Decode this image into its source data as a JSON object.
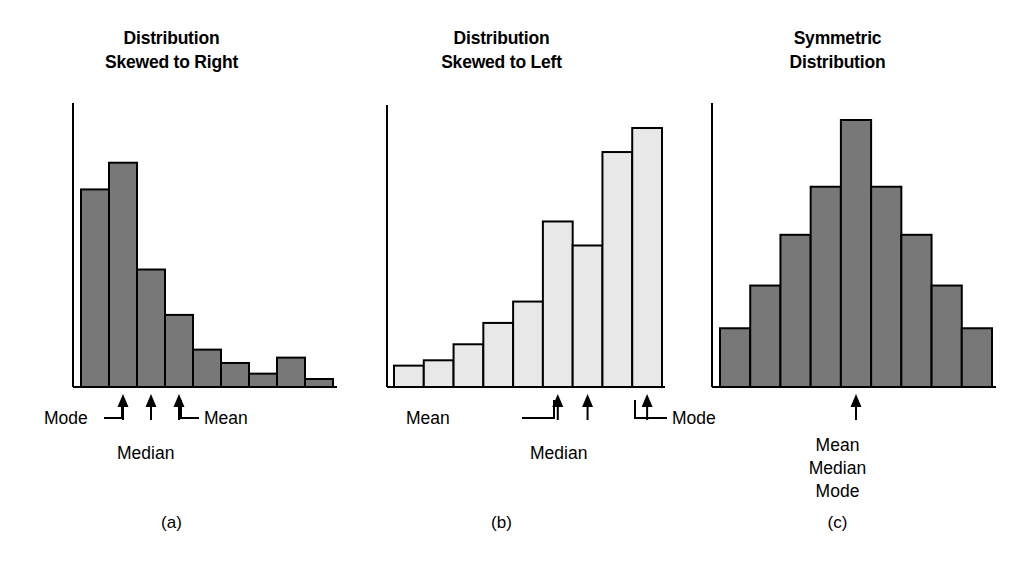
{
  "figure": {
    "caption_a": "(a)",
    "caption_b": "(b)",
    "caption_c": "(c)",
    "colors": {
      "bar_dark": "#787878",
      "bar_light": "#e8e8e8",
      "outline": "#000000",
      "axis": "#000000",
      "background": "#ffffff",
      "text": "#000000"
    }
  },
  "chart_data": [
    {
      "type": "bar",
      "id": "skewed-right",
      "title": "Distribution Skewed to Right",
      "title_line1": "Distribution",
      "title_line2": "Skewed to Right",
      "caption": "(a)",
      "xlabel": "",
      "ylabel": "",
      "grid": false,
      "legend": "none",
      "bar_fill": "#787878",
      "categories": [
        "1",
        "2",
        "3",
        "4",
        "5",
        "6",
        "7",
        "8",
        "9"
      ],
      "values": [
        74,
        84,
        44,
        27,
        14,
        9,
        5,
        11,
        3
      ],
      "ylim": [
        0,
        100
      ],
      "annotations": [
        {
          "name": "Mode",
          "bin": 2,
          "x_frac": 0.185,
          "label_side": "left"
        },
        {
          "name": "Median",
          "bin": 3,
          "x_frac": 0.285,
          "label_side": "below"
        },
        {
          "name": "Mean",
          "bin": 4,
          "x_frac": 0.368,
          "label_side": "right"
        }
      ]
    },
    {
      "type": "bar",
      "id": "skewed-left",
      "title": "Distribution Skewed to Left",
      "title_line1": "Distribution",
      "title_line2": "Skewed to Left",
      "caption": "(b)",
      "xlabel": "",
      "ylabel": "",
      "grid": false,
      "legend": "none",
      "bar_fill": "#e8e8e8",
      "categories": [
        "1",
        "2",
        "3",
        "4",
        "5",
        "6",
        "7",
        "8",
        "9"
      ],
      "values": [
        8,
        10,
        16,
        24,
        32,
        62,
        53,
        88,
        97
      ],
      "ylim": [
        0,
        100
      ],
      "annotations": [
        {
          "name": "Mean",
          "bin": 6,
          "x_frac": 0.6,
          "label_side": "left"
        },
        {
          "name": "Median",
          "bin": 7,
          "x_frac": 0.69,
          "label_side": "below"
        },
        {
          "name": "Mode",
          "bin": 9,
          "x_frac": 0.88,
          "label_side": "right"
        }
      ]
    },
    {
      "type": "bar",
      "id": "symmetric",
      "title": "Symmetric Distribution",
      "title_line1": "Symmetric",
      "title_line2": "Distribution",
      "caption": "(c)",
      "xlabel": "",
      "ylabel": "",
      "grid": false,
      "legend": "none",
      "bar_fill": "#787878",
      "categories": [
        "1",
        "2",
        "3",
        "4",
        "5",
        "6",
        "7",
        "8",
        "9"
      ],
      "values": [
        22,
        38,
        57,
        75,
        100,
        75,
        57,
        38,
        22
      ],
      "ylim": [
        0,
        100
      ],
      "annotations": [
        {
          "name": "Mean Median Mode",
          "bin": 5,
          "x_frac": 0.5,
          "label_side": "stacked"
        }
      ]
    }
  ],
  "labels": {
    "a": {
      "mode": "Mode",
      "median": "Median",
      "mean": "Mean"
    },
    "b": {
      "mean": "Mean",
      "median": "Median",
      "mode": "Mode"
    },
    "c": {
      "mean": "Mean",
      "median": "Median",
      "mode": "Mode"
    }
  }
}
